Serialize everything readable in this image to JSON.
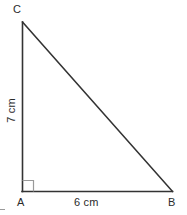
{
  "figure": {
    "type": "right-triangle",
    "background_color": "#ffffff",
    "stroke_color": "#333333",
    "right_angle_color": "#9a9a9a",
    "text_color": "#2b2b2b",
    "vertices": [
      {
        "name": "C",
        "label": "C",
        "x": 22,
        "y": 22
      },
      {
        "name": "A",
        "label": "A",
        "x": 22,
        "y": 191
      },
      {
        "name": "B",
        "label": "B",
        "x": 172,
        "y": 191
      }
    ],
    "sides": [
      {
        "name": "leg-vertical",
        "from": "A",
        "to": "C",
        "label": "7 cm",
        "length_value": 7,
        "unit": "cm",
        "orientation": "vertical"
      },
      {
        "name": "leg-horizontal",
        "from": "A",
        "to": "B",
        "label": "6 cm",
        "length_value": 6,
        "unit": "cm",
        "orientation": "horizontal"
      },
      {
        "name": "hypotenuse",
        "from": "C",
        "to": "B",
        "label": "",
        "orientation": "diagonal"
      }
    ],
    "right_angle": {
      "at_vertex": "A",
      "marker": "square",
      "size": 11
    }
  }
}
